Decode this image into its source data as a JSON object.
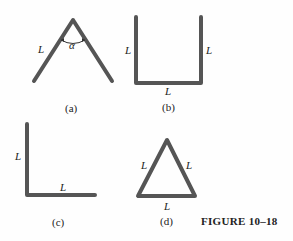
{
  "figure_title": "FIGURE 10–18",
  "panels": [
    {
      "id": "a",
      "caption": "(a)",
      "shape": "inverted-V bent rod",
      "labels": [
        "L"
      ],
      "angle_label": "α"
    },
    {
      "id": "b",
      "caption": "(b)",
      "shape": "U-shaped rod",
      "labels": [
        "L",
        "L",
        "L"
      ]
    },
    {
      "id": "c",
      "caption": "(c)",
      "shape": "L-shaped rod",
      "labels": [
        "L",
        "L"
      ]
    },
    {
      "id": "d",
      "caption": "(d)",
      "shape": "equilateral triangle rod",
      "labels": [
        "L",
        "L",
        "L"
      ]
    }
  ],
  "colors": {
    "rod": "#555555",
    "text": "#222222",
    "background": "#fefefe"
  }
}
